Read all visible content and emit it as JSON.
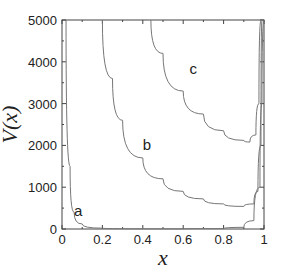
{
  "chart_data": {
    "type": "line",
    "title": "",
    "xlabel": "x",
    "ylabel": "V(x)",
    "xlim": [
      0,
      1
    ],
    "ylim": [
      0,
      5000
    ],
    "xticks": [
      "0",
      "0.2",
      "0.4",
      "0.6",
      "0.8",
      "1"
    ],
    "yticks": [
      "0",
      "1000",
      "2000",
      "3000",
      "4000",
      "5000"
    ],
    "grid": false,
    "legend": "none",
    "series": [
      {
        "name": "a",
        "x": [
          0.02,
          0.04,
          0.06,
          0.1,
          0.2,
          0.4,
          0.6,
          0.8,
          0.9,
          0.95,
          0.98,
          0.99,
          1.0
        ],
        "values": [
          5000,
          1500,
          400,
          120,
          20,
          5,
          5,
          10,
          40,
          200,
          1000,
          3000,
          5000
        ]
      },
      {
        "name": "b",
        "x": [
          0.2,
          0.25,
          0.3,
          0.4,
          0.5,
          0.6,
          0.7,
          0.8,
          0.9,
          0.95,
          0.97,
          0.985,
          0.99
        ],
        "values": [
          5000,
          3600,
          2600,
          1700,
          1200,
          900,
          720,
          600,
          540,
          600,
          900,
          2000,
          5000
        ]
      },
      {
        "name": "c",
        "x": [
          0.44,
          0.5,
          0.6,
          0.7,
          0.8,
          0.9,
          0.93,
          0.96,
          0.975,
          0.985
        ],
        "values": [
          5000,
          4200,
          3300,
          2750,
          2350,
          2120,
          2080,
          2250,
          3000,
          5000
        ]
      }
    ],
    "annotations": [
      {
        "text": "a",
        "x": 0.08,
        "y": 300
      },
      {
        "text": "b",
        "x": 0.42,
        "y": 1900
      },
      {
        "text": "c",
        "x": 0.65,
        "y": 3700
      }
    ]
  }
}
